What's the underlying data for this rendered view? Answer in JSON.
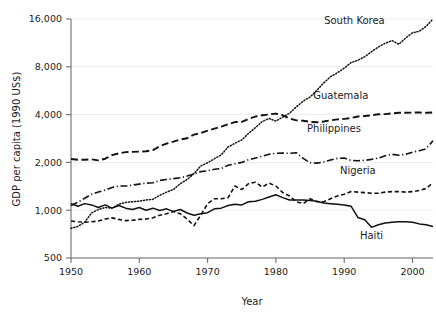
{
  "chart_data": {
    "type": "line",
    "title": "",
    "xlabel": "Year",
    "ylabel": "GDP per capita (1990 US$)",
    "yscale": "log2",
    "xlim": [
      1950,
      2003
    ],
    "ylim": [
      500,
      16000
    ],
    "xticks": [
      1950,
      1960,
      1970,
      1980,
      1990,
      2000
    ],
    "xtick_labels": [
      "1950",
      "1960",
      "1970",
      "1980",
      "1990",
      "2000"
    ],
    "yticks": [
      500,
      1000,
      2000,
      4000,
      8000,
      16000
    ],
    "ytick_labels": [
      "500",
      "1,000",
      "2,000",
      "4,000",
      "8,000",
      "16,000"
    ],
    "grid": "horizontal-faint",
    "legend_position": "inline-right-labels",
    "line_color": "#111111",
    "grid_color": "#ededed",
    "axis_color": "#6e6e6e",
    "x": [
      1950,
      1951,
      1952,
      1953,
      1954,
      1955,
      1956,
      1957,
      1958,
      1959,
      1960,
      1961,
      1962,
      1963,
      1964,
      1965,
      1966,
      1967,
      1968,
      1969,
      1970,
      1971,
      1972,
      1973,
      1974,
      1975,
      1976,
      1977,
      1978,
      1979,
      1980,
      1981,
      1982,
      1983,
      1984,
      1985,
      1986,
      1987,
      1988,
      1989,
      1990,
      1991,
      1992,
      1993,
      1994,
      1995,
      1996,
      1997,
      1998,
      1999,
      2000,
      2001,
      2002,
      2003
    ],
    "series": [
      {
        "name": "South Korea",
        "style": "dotted",
        "label_x": 1991.5,
        "label_y": 14800,
        "values": [
          770,
          790,
          840,
          960,
          1010,
          1040,
          1030,
          1090,
          1120,
          1130,
          1140,
          1160,
          1170,
          1240,
          1300,
          1350,
          1470,
          1560,
          1700,
          1900,
          1990,
          2110,
          2230,
          2500,
          2640,
          2770,
          3050,
          3310,
          3620,
          3780,
          3640,
          3860,
          4080,
          4480,
          4860,
          5160,
          5690,
          6330,
          6930,
          7330,
          7840,
          8500,
          8800,
          9260,
          9960,
          10660,
          11250,
          11700,
          11100,
          12150,
          13100,
          13400,
          14400,
          16000
        ]
      },
      {
        "name": "Guatemala",
        "style": "longdash",
        "label_x": 1989.5,
        "label_y": 5050,
        "values": [
          2100,
          2080,
          2080,
          2090,
          2060,
          2110,
          2220,
          2280,
          2320,
          2330,
          2340,
          2350,
          2390,
          2530,
          2630,
          2700,
          2790,
          2840,
          2990,
          3060,
          3170,
          3260,
          3360,
          3480,
          3590,
          3600,
          3750,
          3890,
          3960,
          4010,
          4060,
          3960,
          3780,
          3680,
          3660,
          3600,
          3580,
          3620,
          3680,
          3730,
          3760,
          3810,
          3890,
          3920,
          3960,
          4020,
          4030,
          4070,
          4110,
          4110,
          4120,
          4120,
          4110,
          4130
        ]
      },
      {
        "name": "Philippines",
        "style": "dashdot",
        "label_x": 1988.5,
        "label_y": 3100,
        "values": [
          1070,
          1120,
          1190,
          1260,
          1300,
          1340,
          1390,
          1420,
          1420,
          1440,
          1460,
          1480,
          1490,
          1540,
          1560,
          1580,
          1600,
          1640,
          1690,
          1750,
          1770,
          1810,
          1830,
          1920,
          1960,
          2000,
          2080,
          2130,
          2190,
          2250,
          2280,
          2290,
          2280,
          2300,
          2120,
          1990,
          1980,
          2010,
          2070,
          2120,
          2130,
          2060,
          2050,
          2060,
          2090,
          2130,
          2200,
          2250,
          2220,
          2250,
          2320,
          2370,
          2440,
          2740
        ]
      },
      {
        "name": "Nigeria",
        "style": "shortdash",
        "label_x": 1992.0,
        "label_y": 1700,
        "values": [
          855,
          845,
          840,
          845,
          855,
          880,
          895,
          875,
          860,
          865,
          875,
          880,
          895,
          930,
          950,
          980,
          950,
          880,
          800,
          930,
          1100,
          1180,
          1180,
          1200,
          1420,
          1350,
          1470,
          1500,
          1400,
          1480,
          1420,
          1290,
          1230,
          1130,
          1100,
          1180,
          1130,
          1130,
          1180,
          1230,
          1260,
          1310,
          1300,
          1290,
          1280,
          1280,
          1300,
          1310,
          1310,
          1300,
          1310,
          1330,
          1370,
          1490
        ]
      },
      {
        "name": "Haiti",
        "style": "solid",
        "label_x": 1994.0,
        "label_y": 660,
        "values": [
          1100,
          1060,
          1100,
          1080,
          1040,
          1080,
          1030,
          1070,
          1030,
          1010,
          1040,
          1000,
          1030,
          995,
          1020,
          980,
          1010,
          960,
          930,
          950,
          965,
          1020,
          1030,
          1070,
          1090,
          1080,
          1130,
          1140,
          1170,
          1210,
          1250,
          1200,
          1160,
          1160,
          1160,
          1150,
          1140,
          1110,
          1100,
          1090,
          1080,
          1060,
          900,
          870,
          780,
          810,
          830,
          840,
          845,
          845,
          840,
          820,
          810,
          790
        ]
      }
    ]
  }
}
